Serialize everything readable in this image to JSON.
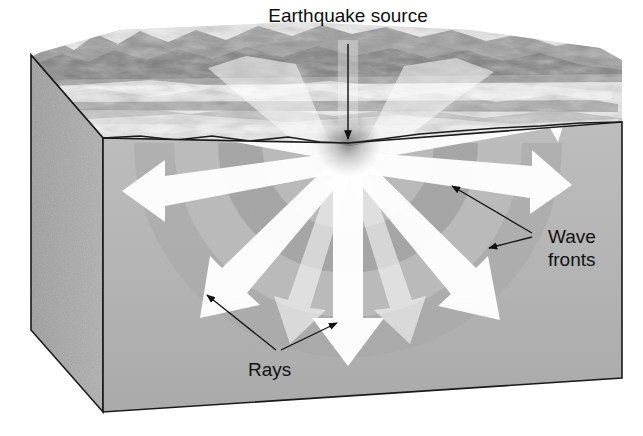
{
  "figure": {
    "kind": "block-diagram",
    "background_color": "#ffffff"
  },
  "labels": {
    "title": "Earthquake source",
    "wave_fronts_line1": "Wave",
    "wave_fronts_line2": "fronts",
    "rays": "Rays"
  },
  "colors": {
    "block_front": "#b3b3b3",
    "block_side": "#a8a8a8",
    "block_outline": "#1a1a1a",
    "wavefront_band": "#9d9d9d",
    "ray_white": "#ffffff",
    "terrain_light": "#f2f2f2",
    "terrain_dark": "#6e6e6e",
    "leader_line": "#111111",
    "text": "#111111"
  },
  "geometry": {
    "focus": {
      "x": 348,
      "y": 143
    },
    "block": {
      "front_top_left": {
        "x": 103,
        "y": 138
      },
      "front_top_right": {
        "x": 622,
        "y": 122
      },
      "front_bottom_left": {
        "x": 103,
        "y": 412
      },
      "front_bottom_right": {
        "x": 622,
        "y": 378
      },
      "side_top_back": {
        "x": 31,
        "y": 55
      },
      "side_bottom_back": {
        "x": 31,
        "y": 330
      }
    },
    "wavefront_radii": [
      42,
      86,
      130,
      174,
      214
    ],
    "ray_angles_deg": [
      180,
      202,
      225,
      247,
      270,
      293,
      315,
      337,
      360
    ],
    "ray_tip_samples": [
      {
        "label": "left",
        "x": 122,
        "y": 183
      },
      {
        "label": "lower-left-diagonal",
        "x": 200,
        "y": 315
      },
      {
        "label": "down",
        "x": 348,
        "y": 365
      },
      {
        "label": "lower-right-diagonal",
        "x": 498,
        "y": 320
      },
      {
        "label": "right",
        "x": 570,
        "y": 185
      }
    ]
  },
  "leaders": {
    "title_arrow": {
      "from_x": 348,
      "from_y": 44,
      "to_x": 348,
      "to_y": 138
    },
    "wave_fronts_arrows": [
      {
        "from_x": 530,
        "from_y": 232,
        "to_x": 452,
        "to_y": 186
      },
      {
        "from_x": 530,
        "from_y": 236,
        "to_x": 490,
        "to_y": 247
      }
    ],
    "rays_arrows": [
      {
        "from_x": 276,
        "from_y": 352,
        "to_x": 206,
        "to_y": 294
      },
      {
        "from_x": 280,
        "from_y": 352,
        "to_x": 338,
        "to_y": 322
      }
    ]
  }
}
